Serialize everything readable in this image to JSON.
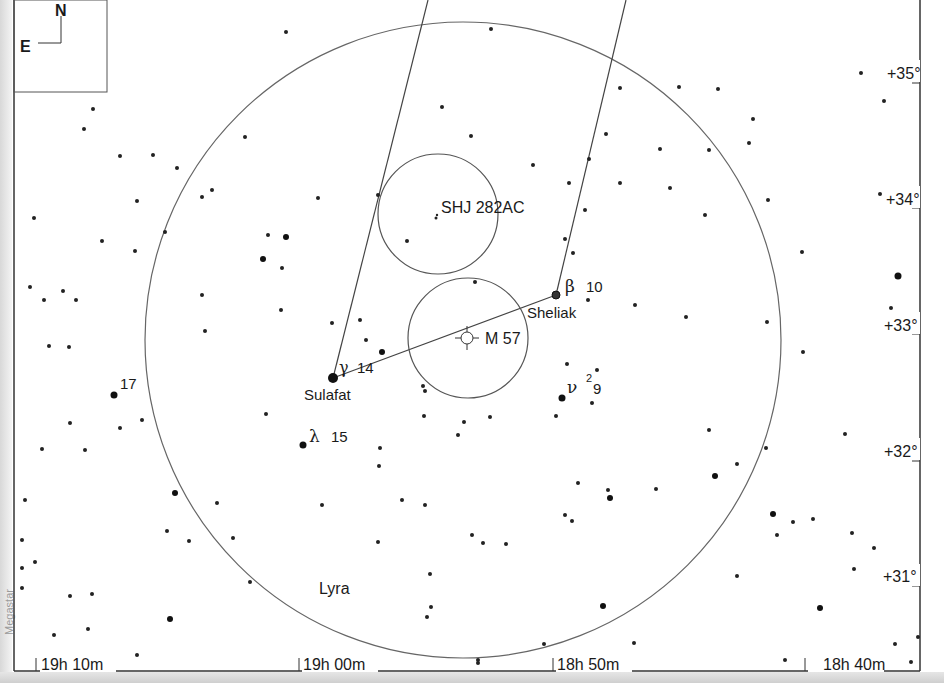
{
  "chart": {
    "constellation_label": "Lyra",
    "compass": {
      "north": "N",
      "east": "E"
    },
    "ra_labels": [
      "19h 10m",
      "19h 00m",
      "18h 50m",
      "18h 40m"
    ],
    "dec_labels": [
      "+35°",
      "+34°",
      "+33°",
      "+32°",
      "+31°"
    ],
    "watermark": "Megastar",
    "objects": {
      "sheliak": {
        "greek": "β",
        "flamsteed": "10",
        "name": "Sheliak"
      },
      "sulafat": {
        "greek": "γ",
        "flamsteed": "14",
        "name": "Sulafat"
      },
      "lambda": {
        "greek": "λ",
        "flamsteed": "15"
      },
      "nu": {
        "greek": "ν",
        "superscript": "2",
        "flamsteed": "9"
      },
      "star17": {
        "flamsteed": "17"
      },
      "m57": {
        "name": "M 57"
      },
      "shj": {
        "name": "SHJ 282AC"
      }
    },
    "colors": {
      "ink": "#1a1a1a",
      "line": "#555555",
      "background": "#ffffff"
    }
  }
}
